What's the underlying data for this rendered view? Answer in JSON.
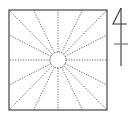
{
  "diagram": {
    "type": "radial-square-layout",
    "colors": {
      "background": "#ffffff",
      "square_stroke": "#444444",
      "radial_stroke": "#555555",
      "circle_stroke": "#555555",
      "symbol_stroke": "#333333",
      "tick_stroke": "#888888"
    },
    "square": {
      "x": 9,
      "y": 10,
      "width": 98,
      "height": 100
    },
    "center_circle": {
      "cx": 58,
      "cy": 60,
      "r": 8
    },
    "radial_line_count": 16,
    "radial_targets": [
      {
        "x": 9,
        "y": 10
      },
      {
        "x": 33.5,
        "y": 10
      },
      {
        "x": 58,
        "y": 10
      },
      {
        "x": 82.5,
        "y": 10
      },
      {
        "x": 107,
        "y": 10
      },
      {
        "x": 107,
        "y": 35
      },
      {
        "x": 107,
        "y": 60
      },
      {
        "x": 107,
        "y": 85
      },
      {
        "x": 107,
        "y": 110
      },
      {
        "x": 82.5,
        "y": 110
      },
      {
        "x": 58,
        "y": 110
      },
      {
        "x": 33.5,
        "y": 110
      },
      {
        "x": 9,
        "y": 110
      },
      {
        "x": 9,
        "y": 85
      },
      {
        "x": 9,
        "y": 60
      },
      {
        "x": 9,
        "y": 35
      }
    ],
    "symbol": {
      "label": "4",
      "vertical_line": {
        "x": 121,
        "y1": 8,
        "y2": 66
      },
      "horizontal_tick": {
        "x1": 114,
        "x2": 128,
        "y": 44
      }
    }
  }
}
